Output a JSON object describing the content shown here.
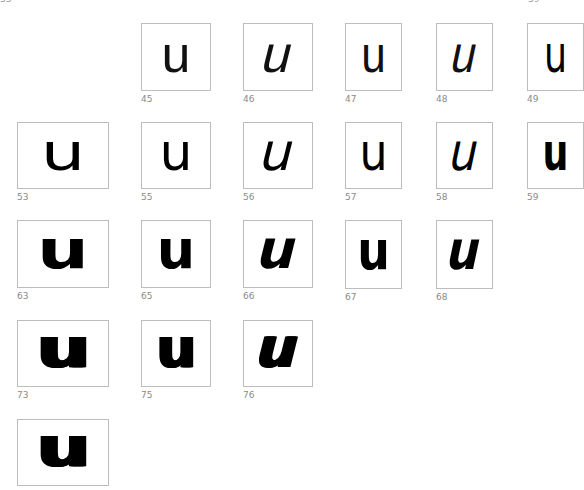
{
  "page": {
    "top_left_label": "33",
    "top_right_label": "39"
  },
  "glyph": "u",
  "specimens": [
    {
      "id": "45",
      "x": 141,
      "y": 23,
      "w": 70,
      "h": 68,
      "weight": 200,
      "italic": false,
      "width_class": "normal",
      "size": 52
    },
    {
      "id": "46",
      "x": 243,
      "y": 23,
      "w": 70,
      "h": 68,
      "weight": 200,
      "italic": true,
      "width_class": "normal",
      "size": 52
    },
    {
      "id": "47",
      "x": 345,
      "y": 23,
      "w": 57,
      "h": 68,
      "weight": 200,
      "italic": false,
      "width_class": "condensed",
      "size": 52
    },
    {
      "id": "48",
      "x": 436,
      "y": 23,
      "w": 57,
      "h": 68,
      "weight": 200,
      "italic": true,
      "width_class": "condensed",
      "size": 52
    },
    {
      "id": "49",
      "x": 527,
      "y": 23,
      "w": 57,
      "h": 68,
      "weight": 300,
      "italic": false,
      "width_class": "ultracondensed",
      "size": 52
    },
    {
      "id": "53",
      "x": 17,
      "y": 122,
      "w": 92,
      "h": 67,
      "weight": 300,
      "italic": false,
      "width_class": "extended",
      "size": 52
    },
    {
      "id": "55",
      "x": 141,
      "y": 122,
      "w": 70,
      "h": 67,
      "weight": 400,
      "italic": false,
      "width_class": "normal",
      "size": 52
    },
    {
      "id": "56",
      "x": 243,
      "y": 122,
      "w": 70,
      "h": 67,
      "weight": 400,
      "italic": true,
      "width_class": "normal",
      "size": 52
    },
    {
      "id": "57",
      "x": 345,
      "y": 122,
      "w": 57,
      "h": 67,
      "weight": 400,
      "italic": false,
      "width_class": "condensed",
      "size": 52
    },
    {
      "id": "58",
      "x": 436,
      "y": 122,
      "w": 57,
      "h": 67,
      "weight": 400,
      "italic": true,
      "width_class": "condensed",
      "size": 52
    },
    {
      "id": "59",
      "x": 527,
      "y": 122,
      "w": 57,
      "h": 67,
      "weight": 700,
      "italic": false,
      "width_class": "ultracondensed",
      "size": 52
    },
    {
      "id": "63",
      "x": 17,
      "y": 220,
      "w": 92,
      "h": 68,
      "weight": 700,
      "italic": false,
      "width_class": "extended",
      "size": 54
    },
    {
      "id": "65",
      "x": 141,
      "y": 220,
      "w": 70,
      "h": 68,
      "weight": 700,
      "italic": false,
      "width_class": "normal",
      "size": 54
    },
    {
      "id": "66",
      "x": 243,
      "y": 220,
      "w": 70,
      "h": 68,
      "weight": 700,
      "italic": true,
      "width_class": "normal",
      "size": 54
    },
    {
      "id": "67",
      "x": 345,
      "y": 220,
      "w": 57,
      "h": 69,
      "weight": 700,
      "italic": false,
      "width_class": "condensed",
      "size": 54
    },
    {
      "id": "68",
      "x": 436,
      "y": 220,
      "w": 57,
      "h": 69,
      "weight": 700,
      "italic": true,
      "width_class": "condensed",
      "size": 54
    },
    {
      "id": "73",
      "x": 17,
      "y": 320,
      "w": 92,
      "h": 67,
      "weight": 900,
      "italic": false,
      "width_class": "extended",
      "size": 56
    },
    {
      "id": "75",
      "x": 141,
      "y": 320,
      "w": 70,
      "h": 67,
      "weight": 900,
      "italic": false,
      "width_class": "normal",
      "size": 56
    },
    {
      "id": "76",
      "x": 243,
      "y": 320,
      "w": 70,
      "h": 67,
      "weight": 900,
      "italic": true,
      "width_class": "normal",
      "size": 56
    },
    {
      "id": "",
      "x": 17,
      "y": 419,
      "w": 92,
      "h": 67,
      "weight": 900,
      "italic": false,
      "width_class": "extended",
      "size": 56
    }
  ]
}
